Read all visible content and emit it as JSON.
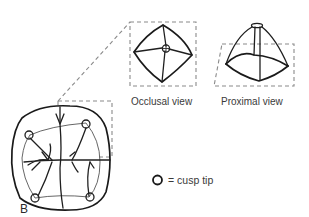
{
  "figure": {
    "panel_label": "B",
    "views": [
      {
        "id": "occlusal",
        "label": "Occlusal view"
      },
      {
        "id": "proximal",
        "label": "Proximal view"
      }
    ],
    "legend": {
      "symbol": "circle",
      "text": "= cusp tip"
    },
    "cusp_count": 4,
    "colors": {
      "ink": "#1f1f1f",
      "dashed_guides": "#8a8a8a",
      "label_text": "#3a3a3a",
      "background": "#ffffff"
    }
  }
}
